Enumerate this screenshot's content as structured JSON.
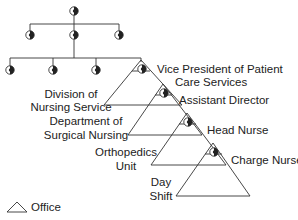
{
  "diagram": {
    "labels": {
      "vp": [
        "Vice President of Patient",
        "Care Services"
      ],
      "division": [
        "Division of",
        "Nursing Service"
      ],
      "assistant": "Assistant Director",
      "department": [
        "Department of",
        "Surgical Nursing"
      ],
      "head_nurse": "Head Nurse",
      "unit": [
        "Orthopedics",
        "Unit"
      ],
      "charge_nurse": "Charge Nurse",
      "shift": [
        "Day",
        "Shift"
      ]
    },
    "legend": {
      "label": "Office",
      "icon": "triangle-icon"
    },
    "node_icon": "eye-node-icon",
    "colors": {
      "line": "#333333",
      "node_fill": "#222222"
    }
  }
}
